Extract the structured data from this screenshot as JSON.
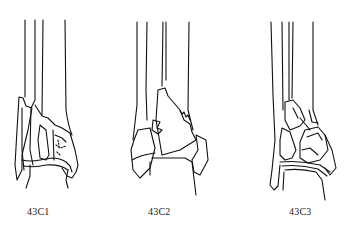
{
  "figure": {
    "panels": [
      {
        "id": "43C1",
        "label": "43C1"
      },
      {
        "id": "43C2",
        "label": "43C2"
      },
      {
        "id": "43C3",
        "label": "43C3"
      }
    ],
    "colors": {
      "line": "#111111",
      "background": "#ffffff"
    }
  }
}
